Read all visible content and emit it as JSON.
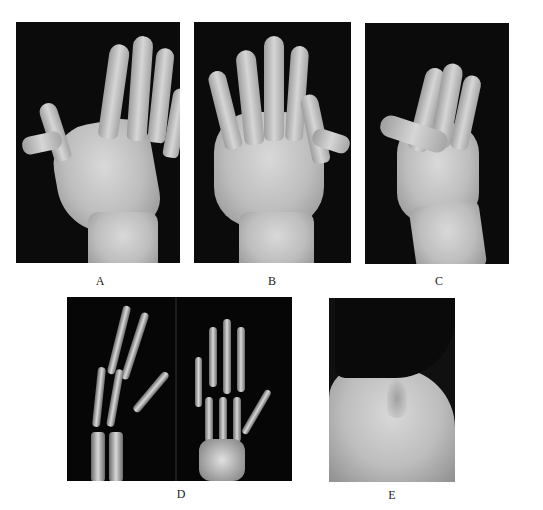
{
  "figure": {
    "panels": [
      {
        "id": "A",
        "label": "A",
        "content": "photo of hand, palmar view"
      },
      {
        "id": "B",
        "label": "B",
        "content": "photo of hand, dorsal view"
      },
      {
        "id": "C",
        "label": "C",
        "content": "photo of hand, lateral flexed view"
      },
      {
        "id": "D",
        "label": "D",
        "content": "X-ray radiographs of hand"
      },
      {
        "id": "E",
        "label": "E",
        "content": "photo of ear and neck, lateral view"
      }
    ]
  }
}
